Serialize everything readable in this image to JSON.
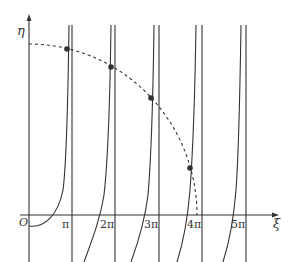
{
  "diagram": {
    "axes": {
      "y_label": "η",
      "x_label": "ξ",
      "origin_label": "O"
    },
    "x_ticks": [
      "π",
      "2π",
      "3π",
      "4π",
      "5π"
    ],
    "curves": {
      "description": "branches of tangent-like curves with vertical asymptotes near multiples of π, intersected by a dashed quarter circle",
      "dashed_circle": "quarter circle centered at origin",
      "intersection_points": 4
    },
    "colors": {
      "line": "#333333",
      "background": "#ffffff"
    }
  }
}
